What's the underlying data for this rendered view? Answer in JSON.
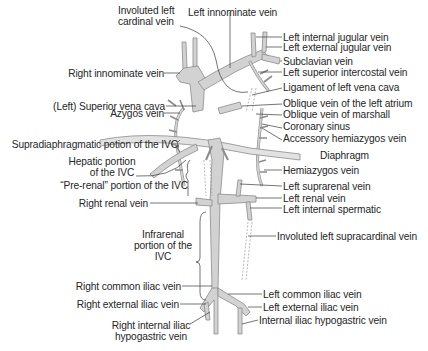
{
  "figure": {
    "colors": {
      "vessel_fill": "#d2d2d2",
      "vessel_outline": "#8c8c8c",
      "leader_line": "#3a3a3a",
      "background": "#ffffff"
    }
  },
  "labels": {
    "involuted_left_cardinal": [
      "Involuted left",
      "cardinal vein"
    ],
    "left_innominate": "Left innominate vein",
    "left_internal_jugular": "Left internal jugular vein",
    "left_external_jugular": "Left external jugular vein",
    "subclavian": "Subclavian vein",
    "left_superior_intercostal": "Left superior intercostal vein",
    "ligament_left_vena_cava": "Ligament of left vena cava",
    "oblique_left_atrium": "Oblique vein of the left atrium",
    "oblique_marshall": "Oblique vein of marshall",
    "coronary_sinus": "Coronary sinus",
    "accessory_hemiazygos": "Accessory hemiazygos vein",
    "diaphragm": "Diaphragm",
    "hemiazygos": "Hemiazygos vein",
    "left_suprarenal": "Left suprarenal vein",
    "left_renal": "Left renal vein",
    "left_internal_spermatic": "Left internal spermatic",
    "involuted_left_supracardinal": "Involuted left supracardinal vein",
    "left_common_iliac": "Left common iliac vein",
    "left_external_iliac": "Left external iliac vein",
    "internal_iliac_hypogastric": "Internal iliac hypogastric vein",
    "right_innominate": "Right innominate vein",
    "left_superior_vena_cava": "(Left) Superior vena cava",
    "azygos": "Azygos vein",
    "supradiaphragmatic_ivc": "Supradiaphragmatic potion of the IVC",
    "hepatic_ivc": [
      "Hepatic portion",
      "of the IVC"
    ],
    "prerenal_ivc": "“Pre-renal” portion of the IVC",
    "right_renal": "Right renal vein",
    "infrarenal_ivc": [
      "Infrarenal",
      "portion of the",
      "IVC"
    ],
    "right_common_iliac": "Right common iliac vein",
    "right_external_iliac": "Right external iliac vein",
    "right_internal_iliac": [
      "Right internal iliac",
      "hypogastric vein"
    ]
  }
}
